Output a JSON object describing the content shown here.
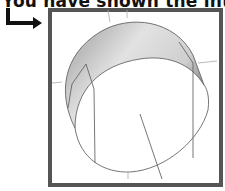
{
  "heading": {
    "text": "You have shown the intersecting r"
  },
  "arrow": {
    "icon": "bent-arrow-right-icon",
    "color": "#111111"
  },
  "figure": {
    "frame_color": "#555555",
    "surface_fill_light": "#e6e6e6",
    "surface_fill_dark": "#8a8a8a",
    "line_color": "#666666",
    "axis_color": "#aaaaaa"
  }
}
